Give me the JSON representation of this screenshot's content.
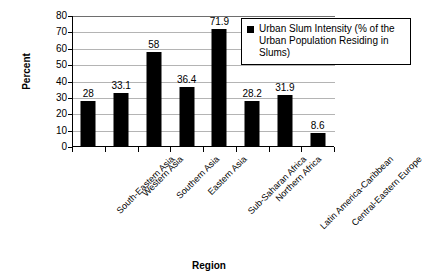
{
  "chart_data": {
    "type": "bar",
    "title": "",
    "subtitle": "",
    "xlabel": "Region",
    "ylabel": "Percent",
    "ylim": [
      0,
      80
    ],
    "ytick_step": 10,
    "yticks": [
      80,
      70,
      60,
      50,
      40,
      30,
      20,
      10,
      0
    ],
    "grid": "horizontal",
    "legend_position": "top-right",
    "bar_color": "#000000",
    "background_color": "#FFFFFF",
    "gridline_color": "#B4B4B4",
    "axis_color": "#000000",
    "categories": [
      "South-Eastern Asia",
      "Western Asia",
      "Southern Asia",
      "Eastern Asia",
      "Sub-Saharan Africa",
      "Northern Africa",
      "Latin America-Caribbean",
      "Central-Eastern Europe"
    ],
    "values": [
      28,
      33.1,
      58,
      36.4,
      71.9,
      28.2,
      31.9,
      8.6
    ],
    "data_labels": [
      "28",
      "33.1",
      "58",
      "36.4",
      "71.9",
      "28.2",
      "31.9",
      "8.6"
    ],
    "series": [
      {
        "name": "Urban Slum Intensity (% of the Urban Population Residing in Slums)",
        "values": [
          28,
          33.1,
          58,
          36.4,
          71.9,
          28.2,
          31.9,
          8.6
        ]
      }
    ]
  },
  "legend": {
    "entries": [
      {
        "label": "Urban Slum Intensity (% of the Urban Population Residing in Slums)",
        "color": "#000000",
        "marker": "square-marker"
      }
    ]
  }
}
